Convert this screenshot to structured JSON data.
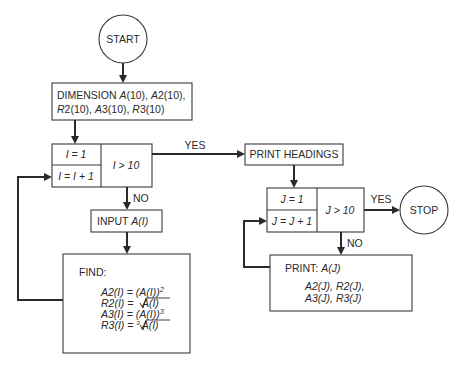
{
  "diagram": {
    "type": "flowchart",
    "start": {
      "label": "START"
    },
    "stop": {
      "label": "STOP"
    },
    "dimension": {
      "line1_prefix": "DIMENSION ",
      "line1_a": "A",
      "line1_b": "(10), ",
      "line1_c": "A",
      "line1_d": "2(10),",
      "line2_a": "R",
      "line2_b": "2(10), ",
      "line2_c": "A",
      "line2_d": "3(10), ",
      "line2_e": "R",
      "line2_f": "3(10)"
    },
    "loop_i": {
      "init": "I = 1",
      "increment": "I = I + 1",
      "test": "I > 10",
      "yes_label": "YES",
      "no_label": "NO"
    },
    "input": {
      "prefix": "INPUT ",
      "var": "A(I)"
    },
    "find": {
      "heading": "FIND:",
      "eq1_lhs": "A2(I) = (A(I))",
      "eq1_exp": "2",
      "eq2_lhs": "R2(I) = ",
      "eq2_rad": "A(I)",
      "eq3_lhs": "A3(I) = (A(I))",
      "eq3_exp": "3",
      "eq4_lhs": "R3(I) = ",
      "eq4_idx": "3",
      "eq4_rad": "A(I)"
    },
    "print_headings": {
      "label": "PRINT HEADINGS"
    },
    "loop_j": {
      "init": "J = 1",
      "increment": "J = J + 1",
      "test": "J > 10",
      "yes_label": "YES",
      "no_label": "NO"
    },
    "print": {
      "prefix": "PRINT:  ",
      "var": "A(J)",
      "line2": "A2(J), R2(J),",
      "line3": "A3(J), R3(J)"
    }
  }
}
